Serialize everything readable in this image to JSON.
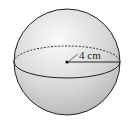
{
  "diagram": {
    "shape": "sphere",
    "radius_label": "4 cm",
    "colors": {
      "outline": "#222222",
      "fill_light": "#f4f4f4",
      "fill_dark": "#bdbdbd"
    }
  }
}
